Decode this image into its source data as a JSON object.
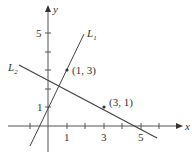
{
  "diagram": {
    "type": "coordinate-plane",
    "axes": {
      "x_label": "x",
      "y_label": "y",
      "x_tick_labels": [
        {
          "value": 1,
          "text": "1"
        },
        {
          "value": 3,
          "text": "3"
        },
        {
          "value": 5,
          "text": "5"
        }
      ],
      "y_tick_labels": [
        {
          "value": 1,
          "text": "1"
        },
        {
          "value": 5,
          "text": "5"
        }
      ],
      "x_ticks": [
        -1,
        1,
        2,
        3,
        4,
        5,
        6
      ],
      "y_ticks": [
        1,
        2,
        3,
        4,
        5
      ]
    },
    "lines": [
      {
        "name": "L",
        "subscript": "1",
        "equation": "y = 2x + 1",
        "through": [
          [
            1,
            3
          ]
        ]
      },
      {
        "name": "L",
        "subscript": "2",
        "equation": "y = -x/2 + 5/2",
        "through": [
          [
            3,
            1
          ],
          [
            5,
            0
          ]
        ]
      }
    ],
    "points": [
      {
        "label": "(1, 3)",
        "x": 1,
        "y": 3
      },
      {
        "label": "(3, 1)",
        "x": 3,
        "y": 1
      }
    ],
    "colors": {
      "axis": "#555555",
      "line": "#444444",
      "text": "#333333"
    }
  }
}
